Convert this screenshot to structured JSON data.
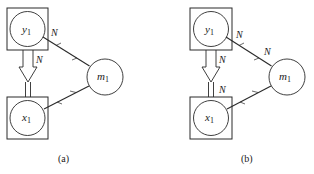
{
  "panels": [
    {
      "id": "a",
      "caption": "(a)",
      "nodes": {
        "y": {
          "base": "y",
          "sub": "1",
          "plate": true
        },
        "x": {
          "base": "x",
          "sub": "1",
          "plate": true
        },
        "m": {
          "base": "m",
          "sub": "1",
          "plate": false
        }
      },
      "labels": {
        "edge_y_m": "N",
        "arrow_top": "N"
      }
    },
    {
      "id": "b",
      "caption": "(b)",
      "nodes": {
        "y": {
          "base": "y",
          "sub": "1",
          "plate": true
        },
        "x": {
          "base": "x",
          "sub": "1",
          "plate": true
        },
        "m": {
          "base": "m",
          "sub": "1",
          "plate": false
        }
      },
      "labels": {
        "edge_y_m_start": "N",
        "edge_y_m_end": "N",
        "arrow_top": "N",
        "arrow_bottom": "N"
      }
    }
  ],
  "colors": {
    "ink": "#2a2a2a",
    "background": "#ffffff"
  }
}
